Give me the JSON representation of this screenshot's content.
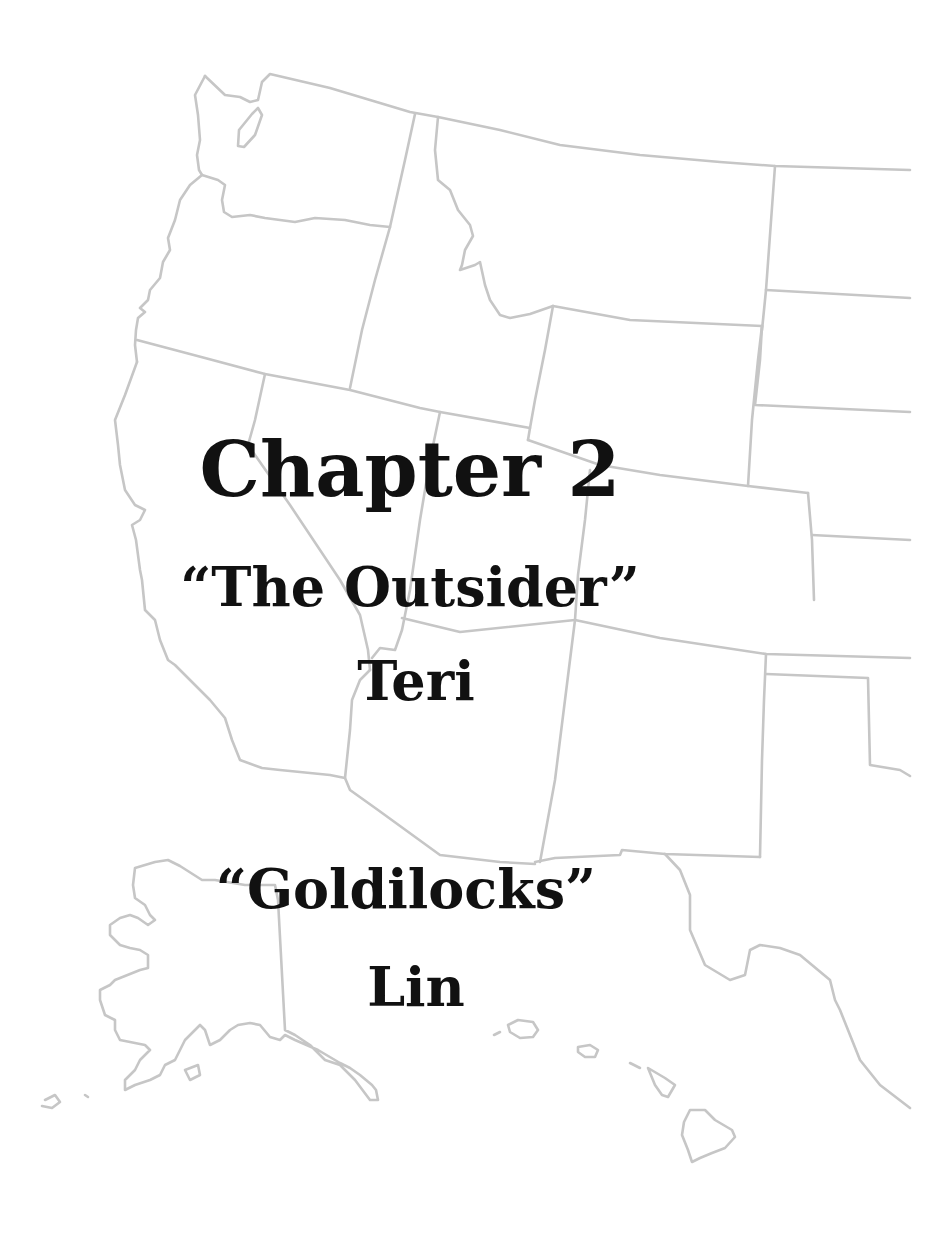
{
  "page": {
    "chapter_heading": "Chapter 2",
    "sections": [
      {
        "title": "“The Outsider”",
        "author": "Teri"
      },
      {
        "title": "“Goldilocks”",
        "author": "Lin"
      }
    ]
  },
  "background": {
    "illustration": "us-western-states-outline-map",
    "includes": [
      "contiguous-western-states",
      "alaska",
      "hawaii"
    ],
    "line_color": "#c6c6c6",
    "background_color": "#ffffff"
  }
}
